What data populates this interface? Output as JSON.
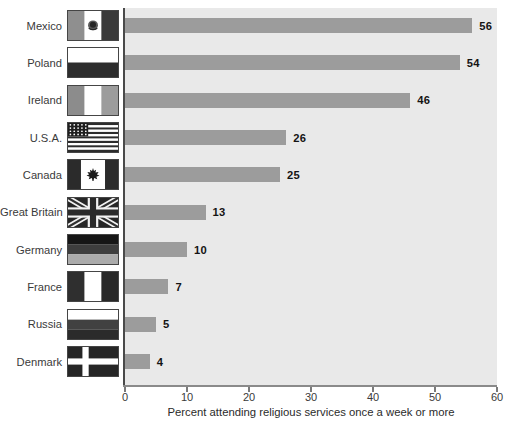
{
  "chart_data": {
    "type": "bar",
    "orientation": "horizontal",
    "title": "",
    "xlabel": "Percent attending religious services once a week or more",
    "ylabel": "",
    "xlim": [
      0,
      60
    ],
    "xticks": [
      0,
      10,
      20,
      30,
      40,
      50,
      60
    ],
    "categories": [
      "Mexico",
      "Poland",
      "Ireland",
      "U.S.A.",
      "Canada",
      "Great Britain",
      "Germany",
      "France",
      "Russia",
      "Denmark"
    ],
    "values": [
      56,
      54,
      46,
      26,
      25,
      13,
      10,
      7,
      5,
      4
    ],
    "flags": [
      "mexico-flag-icon",
      "poland-flag-icon",
      "ireland-flag-icon",
      "usa-flag-icon",
      "canada-flag-icon",
      "great-britain-flag-icon",
      "germany-flag-icon",
      "france-flag-icon",
      "russia-flag-icon",
      "denmark-flag-icon"
    ],
    "bar_color": "#9c9c9c",
    "plot_background": "#e9e9e9",
    "value_label_color": "#141414",
    "grid": false,
    "legend": null
  }
}
